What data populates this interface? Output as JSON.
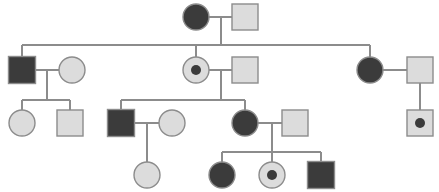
{
  "diagram": {
    "type": "pedigree-chart",
    "colors": {
      "affected_fill": "#3b3b3b",
      "unaffected_fill": "#dcdcdc",
      "outline": "#8c8c8c",
      "background": "#ffffff",
      "carrier_dot": "#3b3b3b"
    },
    "legend": {
      "circle_meaning": "female",
      "square_meaning": "male",
      "filled_meaning": "affected",
      "dotted_meaning": "carrier",
      "open_meaning": "unaffected"
    },
    "generations": [
      {
        "id": "I",
        "y": 17,
        "individuals": [
          {
            "id": "I-1",
            "sex": "female",
            "shape": "circle",
            "status": "affected",
            "carrier": false,
            "cx": 196,
            "cy": 17,
            "r": 13
          },
          {
            "id": "I-2",
            "sex": "male",
            "shape": "square",
            "status": "unaffected",
            "carrier": false,
            "cx": 245,
            "cy": 17,
            "size": 26
          }
        ]
      },
      {
        "id": "II",
        "y": 70,
        "individuals": [
          {
            "id": "II-1",
            "sex": "male",
            "shape": "square",
            "status": "affected",
            "carrier": false,
            "cx": 22,
            "cy": 70,
            "size": 27
          },
          {
            "id": "II-2",
            "sex": "female",
            "shape": "circle",
            "status": "unaffected",
            "carrier": false,
            "cx": 72,
            "cy": 70,
            "r": 13
          },
          {
            "id": "II-3",
            "sex": "female",
            "shape": "circle",
            "status": "unaffected",
            "carrier": true,
            "cx": 196,
            "cy": 70,
            "r": 13
          },
          {
            "id": "II-4",
            "sex": "male",
            "shape": "square",
            "status": "unaffected",
            "carrier": false,
            "cx": 245,
            "cy": 70,
            "size": 26
          },
          {
            "id": "II-5",
            "sex": "female",
            "shape": "circle",
            "status": "affected",
            "carrier": false,
            "cx": 370,
            "cy": 70,
            "r": 13
          },
          {
            "id": "II-6",
            "sex": "male",
            "shape": "square",
            "status": "unaffected",
            "carrier": false,
            "cx": 420,
            "cy": 70,
            "size": 26
          }
        ]
      },
      {
        "id": "III",
        "y": 123,
        "individuals": [
          {
            "id": "III-1",
            "sex": "female",
            "shape": "circle",
            "status": "unaffected",
            "carrier": false,
            "cx": 22,
            "cy": 123,
            "r": 13
          },
          {
            "id": "III-2",
            "sex": "male",
            "shape": "square",
            "status": "unaffected",
            "carrier": false,
            "cx": 70,
            "cy": 123,
            "size": 26
          },
          {
            "id": "III-3",
            "sex": "male",
            "shape": "square",
            "status": "affected",
            "carrier": false,
            "cx": 121,
            "cy": 123,
            "size": 27
          },
          {
            "id": "III-4",
            "sex": "female",
            "shape": "circle",
            "status": "unaffected",
            "carrier": false,
            "cx": 172,
            "cy": 123,
            "r": 13
          },
          {
            "id": "III-5",
            "sex": "female",
            "shape": "circle",
            "status": "affected",
            "carrier": false,
            "cx": 245,
            "cy": 123,
            "r": 13
          },
          {
            "id": "III-6",
            "sex": "male",
            "shape": "square",
            "status": "unaffected",
            "carrier": false,
            "cx": 295,
            "cy": 123,
            "size": 26
          },
          {
            "id": "III-7",
            "sex": "male",
            "shape": "square",
            "status": "unaffected",
            "carrier": true,
            "cx": 420,
            "cy": 123,
            "size": 26
          }
        ]
      },
      {
        "id": "IV",
        "y": 175,
        "individuals": [
          {
            "id": "IV-1",
            "sex": "female",
            "shape": "circle",
            "status": "unaffected",
            "carrier": false,
            "cx": 147,
            "cy": 175,
            "r": 13
          },
          {
            "id": "IV-2",
            "sex": "female",
            "shape": "circle",
            "status": "affected",
            "carrier": false,
            "cx": 222,
            "cy": 175,
            "r": 13
          },
          {
            "id": "IV-3",
            "sex": "female",
            "shape": "circle",
            "status": "unaffected",
            "carrier": true,
            "cx": 272,
            "cy": 175,
            "r": 13
          },
          {
            "id": "IV-4",
            "sex": "male",
            "shape": "square",
            "status": "affected",
            "carrier": false,
            "cx": 321,
            "cy": 175,
            "size": 27
          }
        ]
      }
    ],
    "matings": [
      {
        "id": "mating-I",
        "partners": [
          "I-1",
          "I-2"
        ],
        "line_y": 17,
        "x1": 209,
        "x2": 232,
        "drop_x": 221,
        "drop_to": 45
      },
      {
        "id": "mating-II-a",
        "partners": [
          "II-1",
          "II-2"
        ],
        "line_y": 70,
        "x1": 36,
        "x2": 59,
        "drop_x": 47,
        "drop_to": 100
      },
      {
        "id": "mating-II-b",
        "partners": [
          "II-3",
          "II-4"
        ],
        "line_y": 70,
        "x1": 209,
        "x2": 232,
        "drop_x": 221,
        "drop_to": 100
      },
      {
        "id": "mating-II-c",
        "partners": [
          "II-5",
          "II-6"
        ],
        "line_y": 70,
        "x1": 383,
        "x2": 407,
        "drop_x": 420,
        "drop_to": 110
      },
      {
        "id": "mating-III-a",
        "partners": [
          "III-3",
          "III-4"
        ],
        "line_y": 123,
        "x1": 135,
        "x2": 159,
        "drop_x": 147,
        "drop_to": 162
      },
      {
        "id": "mating-III-b",
        "partners": [
          "III-5",
          "III-6"
        ],
        "line_y": 123,
        "x1": 258,
        "x2": 282,
        "drop_x": 272,
        "drop_to": 152
      }
    ],
    "sibships": [
      {
        "id": "sibship-II",
        "parent_mating": "mating-I",
        "bar_y": 45,
        "x_left": 22,
        "x_right": 370,
        "children_x": [
          22,
          196,
          370
        ]
      },
      {
        "id": "sibship-III-left",
        "parent_mating": "mating-II-a",
        "bar_y": 100,
        "x_left": 22,
        "x_right": 70,
        "children_x": [
          22,
          70
        ]
      },
      {
        "id": "sibship-III-mid",
        "parent_mating": "mating-II-b",
        "bar_y": 100,
        "x_left": 121,
        "x_right": 245,
        "children_x": [
          121,
          245
        ]
      },
      {
        "id": "sibship-IV-right",
        "parent_mating": "mating-III-b",
        "bar_y": 152,
        "x_left": 222,
        "x_right": 321,
        "children_x": [
          222,
          272,
          321
        ]
      }
    ],
    "counts": {
      "total_individuals": 19,
      "affected": 7,
      "carriers": 3,
      "generations": 4
    }
  }
}
